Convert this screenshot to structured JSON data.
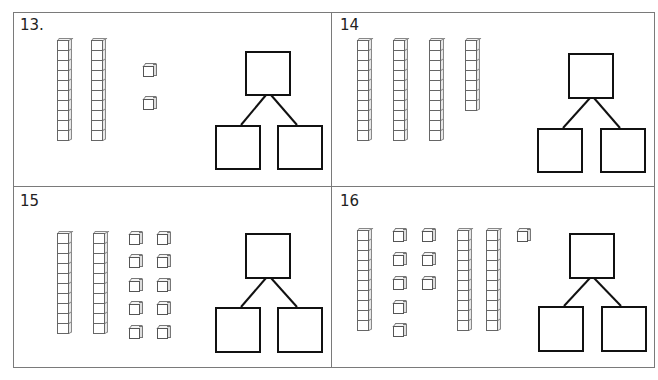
{
  "problems": [
    {
      "number_label": "13.",
      "tens_rods": 2,
      "ones_cubes": 2,
      "number_bond": {
        "whole": "",
        "part_left": "",
        "part_right": ""
      }
    },
    {
      "number_label": "14",
      "tens_rods": 3,
      "partial_rod_units": 7,
      "ones_cubes": 0,
      "number_bond": {
        "whole": "",
        "part_left": "",
        "part_right": ""
      }
    },
    {
      "number_label": "15",
      "tens_rods": 2,
      "ones_cubes": 10,
      "number_bond": {
        "whole": "",
        "part_left": "",
        "part_right": ""
      }
    },
    {
      "number_label": "16",
      "tens_rods": 3,
      "ones_cubes": 9,
      "number_bond": {
        "whole": "",
        "part_left": "",
        "part_right": ""
      }
    }
  ],
  "colors": {
    "border": "#7a7a7a",
    "bond_stroke": "#111111",
    "block_stroke": "#666666"
  }
}
